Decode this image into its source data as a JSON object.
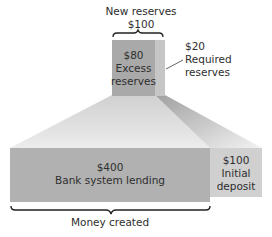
{
  "diagram": {
    "top_label": {
      "title": "New reserves",
      "amount": "$100"
    },
    "excess_reserves": {
      "amount": "$80",
      "line1": "Excess",
      "line2": "reserves"
    },
    "required_reserves": {
      "amount": "$20",
      "line1": "Required",
      "line2": "reserves"
    },
    "bank_lending": {
      "amount": "$400",
      "label": "Bank system lending"
    },
    "initial_deposit": {
      "amount": "$100",
      "line1": "Initial",
      "line2": "deposit"
    },
    "bottom_label": "Money created"
  },
  "colors": {
    "excess_box": "#a8a8a8",
    "required_strip": "#c4c4c4",
    "lending_box": "#b0b0b0",
    "deposit_box": "#cfcfcf",
    "brace": "#222222"
  }
}
